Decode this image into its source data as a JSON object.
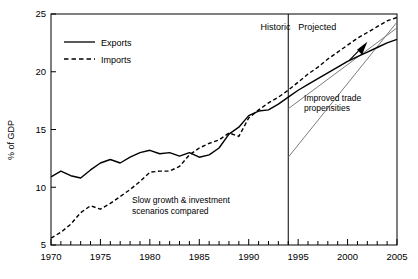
{
  "chart_data": {
    "type": "line",
    "title": "",
    "xlabel": "",
    "ylabel": "% of GDP",
    "xlim": [
      1970,
      2005
    ],
    "ylim": [
      5,
      25
    ],
    "ytick_labels": [
      "5",
      "10",
      "15",
      "20",
      "25"
    ],
    "yticks": [
      5,
      10,
      15,
      20,
      25
    ],
    "xtick_labels": [
      "1970",
      "1975",
      "1980",
      "1985",
      "1990",
      "1995",
      "2000",
      "2005"
    ],
    "xticks": [
      1970,
      1975,
      1980,
      1985,
      1990,
      1995,
      2000,
      2005
    ],
    "minor_xtick_interval": 1,
    "grid": false,
    "legend_position": "top-left",
    "x": [
      1970,
      1971,
      1972,
      1973,
      1974,
      1975,
      1976,
      1977,
      1978,
      1979,
      1980,
      1981,
      1982,
      1983,
      1984,
      1985,
      1986,
      1987,
      1988,
      1989,
      1990,
      1991,
      1992,
      1993,
      1994,
      1995,
      1996,
      1997,
      1998,
      1999,
      2000,
      2001,
      2002,
      2003,
      2004,
      2005
    ],
    "series": [
      {
        "name": "Exports",
        "style": "solid",
        "values": [
          10.9,
          11.4,
          11.0,
          10.8,
          11.5,
          12.1,
          12.4,
          12.1,
          12.6,
          13.0,
          13.2,
          12.9,
          13.0,
          12.7,
          13.0,
          12.6,
          12.8,
          13.4,
          14.6,
          15.2,
          16.2,
          16.6,
          16.7,
          17.2,
          17.8,
          18.4,
          18.9,
          19.4,
          19.9,
          20.4,
          20.9,
          21.3,
          21.7,
          22.1,
          22.5,
          22.8
        ]
      },
      {
        "name": "Imports",
        "style": "dashed",
        "values": [
          5.6,
          6.1,
          6.8,
          7.8,
          8.4,
          8.1,
          8.6,
          9.2,
          9.8,
          10.5,
          11.3,
          11.4,
          11.4,
          11.8,
          12.8,
          13.4,
          13.8,
          14.1,
          14.7,
          14.4,
          16.0,
          16.7,
          17.3,
          17.8,
          18.4,
          19.1,
          19.8,
          20.4,
          21.1,
          21.7,
          22.3,
          22.9,
          23.4,
          23.9,
          24.4,
          24.7
        ]
      }
    ],
    "scenario_lines": [
      {
        "name": "improved-trade-exports",
        "x": [
          1994,
          2005
        ],
        "values": [
          16.8,
          23.8
        ]
      },
      {
        "name": "improved-trade-imports",
        "x": [
          1994,
          2005
        ],
        "values": [
          12.6,
          24.3
        ]
      }
    ],
    "annotations": [
      {
        "name": "historic-band-label",
        "text": "Historic",
        "x": 1991.2,
        "y": 23.6
      },
      {
        "name": "projected-band-label",
        "text": "Projected",
        "x": 1995.0,
        "y": 23.6
      },
      {
        "name": "scenarios-note",
        "text_lines": [
          "Slow growth & investment",
          "scenarios compared"
        ],
        "x": 1978.2,
        "y": 8.6
      },
      {
        "name": "improved-trade-note",
        "text_lines": [
          "Improved trade",
          "propensities"
        ],
        "x": 1995.6,
        "y": 17.5
      }
    ],
    "divider": {
      "name": "historic-projected-divider",
      "x": 1994
    },
    "arrow": {
      "name": "improved-trade-arrow",
      "from": [
        2000.2,
        21.0
      ],
      "to": [
        2002.0,
        22.6
      ]
    },
    "colors": {
      "line": "#000000",
      "axis": "#000000",
      "scenario": "#6d6d6d",
      "background": "#ffffff"
    }
  },
  "legend": {
    "items": [
      {
        "label": "Exports",
        "style": "solid"
      },
      {
        "label": "Imports",
        "style": "dashed"
      }
    ]
  }
}
